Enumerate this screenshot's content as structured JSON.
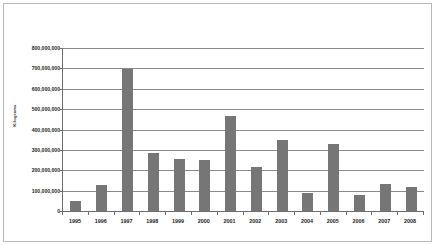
{
  "chart_data": {
    "type": "bar",
    "title": "",
    "subtitle": "",
    "xlabel": "",
    "ylabel": "Kilograms",
    "categories": [
      "1995",
      "1996",
      "1997",
      "1998",
      "1999",
      "2000",
      "2001",
      "2002",
      "2003",
      "2004",
      "2005",
      "2006",
      "2007",
      "2008"
    ],
    "values": [
      48000000,
      128000000,
      697000000,
      287000000,
      255000000,
      250000000,
      465000000,
      217000000,
      348000000,
      90000000,
      330000000,
      78000000,
      135000000,
      117000000
    ],
    "ylim": [
      0,
      800000000
    ],
    "ytick_values": [
      0,
      100000000,
      200000000,
      300000000,
      400000000,
      500000000,
      600000000,
      700000000,
      800000000
    ],
    "ytick_labels": [
      "0",
      "100,000,000",
      "200,000,000",
      "300,000,000",
      "400,000,000",
      "500,000,000",
      "600,000,000",
      "700,000,000",
      "800,000,000"
    ],
    "grid": true,
    "legend": null,
    "legend_position": "none",
    "bar_color": "#767676",
    "axis_color": "#6e6e6e",
    "gridline_color": "#8a8a8a",
    "plot_background": "#ffffff",
    "frame_color": "#b9b9b9"
  }
}
